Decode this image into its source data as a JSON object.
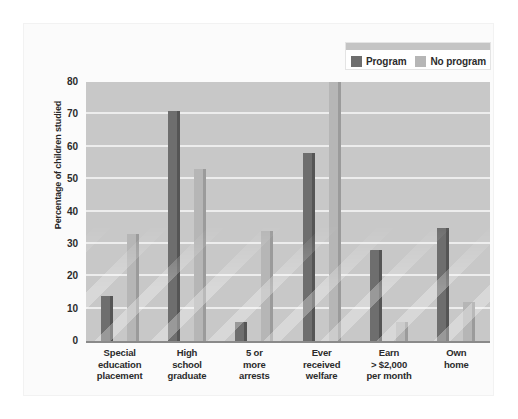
{
  "chart_data": {
    "type": "bar",
    "title": "",
    "xlabel": "",
    "ylabel": "Percentage of children studied",
    "ylim": [
      0,
      80
    ],
    "yticks": [
      0,
      10,
      20,
      30,
      40,
      50,
      60,
      70,
      80
    ],
    "grid": true,
    "legend_position": "top-right",
    "categories": [
      "Special education placement",
      "High school graduate",
      "5 or more arrests",
      "Ever received welfare",
      "Earn > $2,000 per month",
      "Own home"
    ],
    "category_lines": [
      [
        "Special",
        "education",
        "placement"
      ],
      [
        "High",
        "school",
        "graduate"
      ],
      [
        "5 or",
        "more",
        "arrests"
      ],
      [
        "Ever",
        "received",
        "welfare"
      ],
      [
        "Earn",
        "> $2,000",
        "per month"
      ],
      [
        "Own",
        "home"
      ]
    ],
    "series": [
      {
        "name": "Program",
        "color": "#6e6e6e",
        "values": [
          14,
          71,
          6,
          58,
          28,
          35
        ]
      },
      {
        "name": "No program",
        "color": "#b6b6b6",
        "values": [
          33,
          53,
          34,
          80,
          6,
          12
        ]
      }
    ]
  },
  "legend": {
    "entries": [
      {
        "label": "Program"
      },
      {
        "label": "No program"
      }
    ]
  },
  "colors": {
    "program": "#6e6e6e",
    "program_side": "#555555",
    "no_program": "#b6b6b6",
    "no_program_side": "#9b9b9b",
    "plot_background": "#c8c8c8",
    "gridline": "#ededed",
    "axis": "#8a8a8a",
    "text": "#2b2b2b",
    "page_background": "#ffffff"
  }
}
